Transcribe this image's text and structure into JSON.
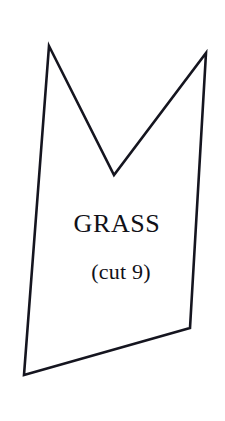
{
  "canvas": {
    "width": 225,
    "height": 421,
    "background_color": "#ffffff"
  },
  "pattern_piece": {
    "name": "pattern-piece-grass",
    "label": "GRASS",
    "quantity_label": "(cut 9)",
    "outline_color": "#15151f",
    "fill_color": "#ffffff",
    "stroke_width": 2.6,
    "shape_type": "notched-quadrilateral",
    "points_attr": "49,46 114,175 206,53 190,328 24,375",
    "vertices": [
      {
        "name": "top-left-peak",
        "x": 49,
        "y": 46
      },
      {
        "name": "notch-bottom",
        "x": 114,
        "y": 175
      },
      {
        "name": "top-right-peak",
        "x": 206,
        "y": 53
      },
      {
        "name": "bottom-right-corner",
        "x": 190,
        "y": 328
      },
      {
        "name": "bottom-left-corner",
        "x": 24,
        "y": 375
      }
    ],
    "label_position": {
      "x": 117,
      "y": 232
    },
    "quantity_position": {
      "x": 121,
      "y": 279
    }
  }
}
